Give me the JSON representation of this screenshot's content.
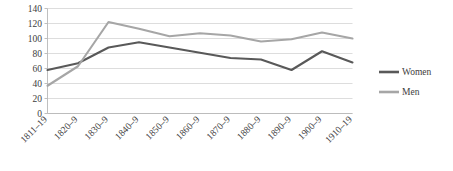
{
  "chart_data": {
    "type": "line",
    "title": "",
    "subtitle": "",
    "xlabel": "",
    "ylabel": "",
    "categories": [
      "1811–19",
      "1820–9",
      "1830–9",
      "1840–9",
      "1850–9",
      "1860–9",
      "1870–9",
      "1880–9",
      "1890–9",
      "1900–9",
      "1910–19"
    ],
    "series": [
      {
        "name": "Women",
        "color": "#595959",
        "values": [
          58,
          67,
          88,
          95,
          88,
          81,
          74,
          72,
          58,
          83,
          68
        ]
      },
      {
        "name": "Men",
        "color": "#a6a6a6",
        "values": [
          37,
          63,
          122,
          113,
          103,
          107,
          104,
          96,
          99,
          108,
          100
        ]
      }
    ],
    "ylim": [
      0,
      140
    ],
    "yticks": [
      0,
      20,
      40,
      60,
      80,
      100,
      120,
      140
    ],
    "ytick_labels": [
      "0",
      "20",
      "40",
      "60",
      "80",
      "100",
      "120",
      "140"
    ],
    "grid": true,
    "grid_axis": "y",
    "legend": {
      "position": "right",
      "entries": [
        "Women",
        "Men"
      ]
    }
  }
}
